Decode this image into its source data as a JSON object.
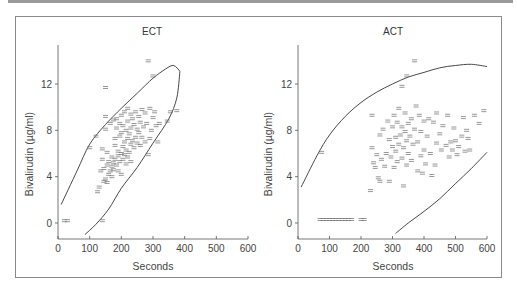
{
  "chart_data": [
    {
      "type": "scatter",
      "title": "ECT",
      "xlabel": "Seconds",
      "ylabel": "Bivalirudin (µg/ml)",
      "xlim": [
        0,
        600
      ],
      "ylim": [
        -1.5,
        15
      ],
      "xticks": [
        0,
        100,
        200,
        300,
        400,
        500,
        600
      ],
      "yticks": [
        0,
        4,
        8,
        12
      ],
      "grid": false,
      "legend": null,
      "marker": "=",
      "points": [
        [
          20,
          0.2
        ],
        [
          30,
          0.2
        ],
        [
          140,
          0.2
        ],
        [
          285,
          14
        ],
        [
          300,
          12.7
        ],
        [
          150,
          11.7
        ],
        [
          100,
          6.5
        ],
        [
          120,
          7.5
        ],
        [
          125,
          2.7
        ],
        [
          130,
          3.1
        ],
        [
          135,
          4.5
        ],
        [
          140,
          5.5
        ],
        [
          140,
          6.4
        ],
        [
          145,
          3.6
        ],
        [
          145,
          4.7
        ],
        [
          150,
          3.8
        ],
        [
          150,
          8.1
        ],
        [
          150,
          9.2
        ],
        [
          155,
          3.5
        ],
        [
          155,
          5.0
        ],
        [
          155,
          6.1
        ],
        [
          160,
          4.2
        ],
        [
          160,
          5.3
        ],
        [
          165,
          4.5
        ],
        [
          165,
          8.6
        ],
        [
          170,
          4.0
        ],
        [
          170,
          4.9
        ],
        [
          170,
          5.7
        ],
        [
          175,
          5.2
        ],
        [
          175,
          8.9
        ],
        [
          175,
          4.6
        ],
        [
          180,
          5.5
        ],
        [
          180,
          6.7
        ],
        [
          180,
          7.3
        ],
        [
          185,
          5.0
        ],
        [
          185,
          8.2
        ],
        [
          185,
          9.0
        ],
        [
          190,
          5.8
        ],
        [
          190,
          6.2
        ],
        [
          190,
          4.5
        ],
        [
          195,
          5.3
        ],
        [
          195,
          7.5
        ],
        [
          195,
          8.6
        ],
        [
          200,
          4.2
        ],
        [
          200,
          6.0
        ],
        [
          200,
          7.8
        ],
        [
          200,
          9.3
        ],
        [
          205,
          5.5
        ],
        [
          205,
          6.6
        ],
        [
          205,
          8.4
        ],
        [
          210,
          5.9
        ],
        [
          210,
          7.0
        ],
        [
          210,
          9.6
        ],
        [
          215,
          5.1
        ],
        [
          215,
          6.3
        ],
        [
          215,
          8.0
        ],
        [
          220,
          5.7
        ],
        [
          220,
          7.3
        ],
        [
          220,
          8.8
        ],
        [
          220,
          9.9
        ],
        [
          225,
          6.1
        ],
        [
          225,
          7.7
        ],
        [
          230,
          5.3
        ],
        [
          230,
          6.8
        ],
        [
          230,
          8.2
        ],
        [
          230,
          9.4
        ],
        [
          235,
          7.1
        ],
        [
          235,
          9.0
        ],
        [
          240,
          6.5
        ],
        [
          240,
          8.5
        ],
        [
          245,
          7.4
        ],
        [
          245,
          9.6
        ],
        [
          250,
          6.9
        ],
        [
          250,
          8.1
        ],
        [
          255,
          7.8
        ],
        [
          255,
          9.2
        ],
        [
          260,
          6.7
        ],
        [
          260,
          8.7
        ],
        [
          265,
          7.4
        ],
        [
          265,
          9.8
        ],
        [
          270,
          8.3
        ],
        [
          275,
          7.0
        ],
        [
          275,
          9.5
        ],
        [
          280,
          8.6
        ],
        [
          285,
          5.9
        ],
        [
          290,
          7.3
        ],
        [
          290,
          9.9
        ],
        [
          295,
          8.0
        ],
        [
          300,
          9.1
        ],
        [
          305,
          9.6
        ],
        [
          310,
          8.4
        ],
        [
          315,
          7.0
        ],
        [
          320,
          8.6
        ],
        [
          345,
          8.8
        ],
        [
          355,
          9.6
        ],
        [
          375,
          9.7
        ]
      ],
      "curves": [
        {
          "name": "prediction-ellipse-upper",
          "points": [
            [
              10,
              1.6
            ],
            [
              60,
              4.5
            ],
            [
              100,
              6.8
            ],
            [
              150,
              8.5
            ],
            [
              200,
              9.9
            ],
            [
              250,
              11.2
            ],
            [
              300,
              12.5
            ],
            [
              340,
              13.3
            ],
            [
              365,
              13.6
            ],
            [
              385,
              13.1
            ]
          ]
        },
        {
          "name": "prediction-ellipse-lower",
          "points": [
            [
              385,
              13.1
            ],
            [
              375,
              10.8
            ],
            [
              350,
              9.0
            ],
            [
              300,
              6.9
            ],
            [
              250,
              4.8
            ],
            [
              200,
              3.0
            ],
            [
              160,
              1.2
            ],
            [
              120,
              -0.1
            ],
            [
              85,
              -1.0
            ]
          ]
        }
      ]
    },
    {
      "type": "scatter",
      "title": "ACT",
      "xlabel": "Seconds",
      "ylabel": "Bivalirudin (µg/ml)",
      "xlim": [
        0,
        600
      ],
      "ylim": [
        -1.5,
        15
      ],
      "xticks": [
        0,
        100,
        200,
        300,
        400,
        500,
        600
      ],
      "yticks": [
        0,
        4,
        8,
        12
      ],
      "grid": false,
      "legend": null,
      "marker": "=",
      "points": [
        [
          70,
          0.3
        ],
        [
          80,
          0.3
        ],
        [
          90,
          0.3
        ],
        [
          100,
          0.3
        ],
        [
          110,
          0.3
        ],
        [
          120,
          0.3
        ],
        [
          130,
          0.3
        ],
        [
          140,
          0.3
        ],
        [
          150,
          0.3
        ],
        [
          160,
          0.3
        ],
        [
          170,
          0.3
        ],
        [
          200,
          0.3
        ],
        [
          210,
          0.3
        ],
        [
          75,
          6.1
        ],
        [
          370,
          14
        ],
        [
          345,
          12.7
        ],
        [
          330,
          11.8
        ],
        [
          230,
          2.8
        ],
        [
          235,
          6.5
        ],
        [
          235,
          9.3
        ],
        [
          240,
          5.2
        ],
        [
          245,
          4.8
        ],
        [
          250,
          5.9
        ],
        [
          255,
          3.9
        ],
        [
          260,
          3.6
        ],
        [
          260,
          7.6
        ],
        [
          265,
          5.5
        ],
        [
          270,
          8.1
        ],
        [
          275,
          4.9
        ],
        [
          280,
          6.0
        ],
        [
          285,
          8.8
        ],
        [
          290,
          3.6
        ],
        [
          290,
          7.2
        ],
        [
          295,
          5.7
        ],
        [
          300,
          6.6
        ],
        [
          300,
          8.3
        ],
        [
          305,
          4.8
        ],
        [
          305,
          9.3
        ],
        [
          310,
          6.2
        ],
        [
          310,
          7.4
        ],
        [
          315,
          5.3
        ],
        [
          315,
          8.7
        ],
        [
          320,
          6.8
        ],
        [
          320,
          9.9
        ],
        [
          325,
          7.6
        ],
        [
          330,
          5.6
        ],
        [
          330,
          8.3
        ],
        [
          335,
          3.2
        ],
        [
          335,
          6.5
        ],
        [
          340,
          7.9
        ],
        [
          340,
          9.5
        ],
        [
          345,
          5.0
        ],
        [
          345,
          7.1
        ],
        [
          350,
          6.0
        ],
        [
          350,
          8.6
        ],
        [
          355,
          7.5
        ],
        [
          360,
          5.4
        ],
        [
          360,
          9.0
        ],
        [
          365,
          6.8
        ],
        [
          370,
          8.1
        ],
        [
          375,
          10.1
        ],
        [
          380,
          4.5
        ],
        [
          380,
          7.0
        ],
        [
          385,
          9.3
        ],
        [
          390,
          5.8
        ],
        [
          390,
          7.9
        ],
        [
          395,
          4.3
        ],
        [
          400,
          6.3
        ],
        [
          400,
          8.8
        ],
        [
          405,
          5.1
        ],
        [
          410,
          7.5
        ],
        [
          415,
          9.0
        ],
        [
          420,
          6.0
        ],
        [
          425,
          4.1
        ],
        [
          430,
          8.7
        ],
        [
          435,
          5.0
        ],
        [
          440,
          6.9
        ],
        [
          440,
          9.5
        ],
        [
          450,
          7.7
        ],
        [
          455,
          6.3
        ],
        [
          460,
          8.4
        ],
        [
          470,
          6.7
        ],
        [
          475,
          9.3
        ],
        [
          480,
          5.7
        ],
        [
          485,
          7.0
        ],
        [
          490,
          6.3
        ],
        [
          495,
          8.2
        ],
        [
          500,
          7.1
        ],
        [
          505,
          5.9
        ],
        [
          510,
          6.6
        ],
        [
          520,
          7.5
        ],
        [
          525,
          9.1
        ],
        [
          530,
          6.2
        ],
        [
          535,
          8.0
        ],
        [
          540,
          7.3
        ],
        [
          545,
          6.3
        ],
        [
          560,
          9.3
        ],
        [
          575,
          8.6
        ],
        [
          590,
          9.7
        ]
      ],
      "curves": [
        {
          "name": "prediction-band-upper",
          "points": [
            [
              10,
              3.1
            ],
            [
              60,
              5.8
            ],
            [
              100,
              7.6
            ],
            [
              150,
              9.2
            ],
            [
              200,
              10.4
            ],
            [
              250,
              11.3
            ],
            [
              300,
              12.0
            ],
            [
              350,
              12.6
            ],
            [
              400,
              13.0
            ],
            [
              450,
              13.4
            ],
            [
              500,
              13.6
            ],
            [
              550,
              13.7
            ],
            [
              600,
              13.5
            ]
          ]
        },
        {
          "name": "prediction-band-lower",
          "points": [
            [
              310,
              -0.9
            ],
            [
              350,
              0.0
            ],
            [
              400,
              1.0
            ],
            [
              450,
              2.1
            ],
            [
              500,
              3.4
            ],
            [
              550,
              4.7
            ],
            [
              600,
              6.1
            ]
          ]
        }
      ]
    }
  ],
  "panels": [
    {
      "title": "ECT",
      "xlabel": "Seconds",
      "ylabel": "Bivalirudin (µg/ml)"
    },
    {
      "title": "ACT",
      "xlabel": "Seconds",
      "ylabel": "Bivalirudin (µg/ml)"
    }
  ],
  "colors": {
    "axis": "#555555",
    "curve": "#333333",
    "marker": "#6a6a6a",
    "frame": "#8a8a8a",
    "top_rule": "#9a9a9a"
  }
}
